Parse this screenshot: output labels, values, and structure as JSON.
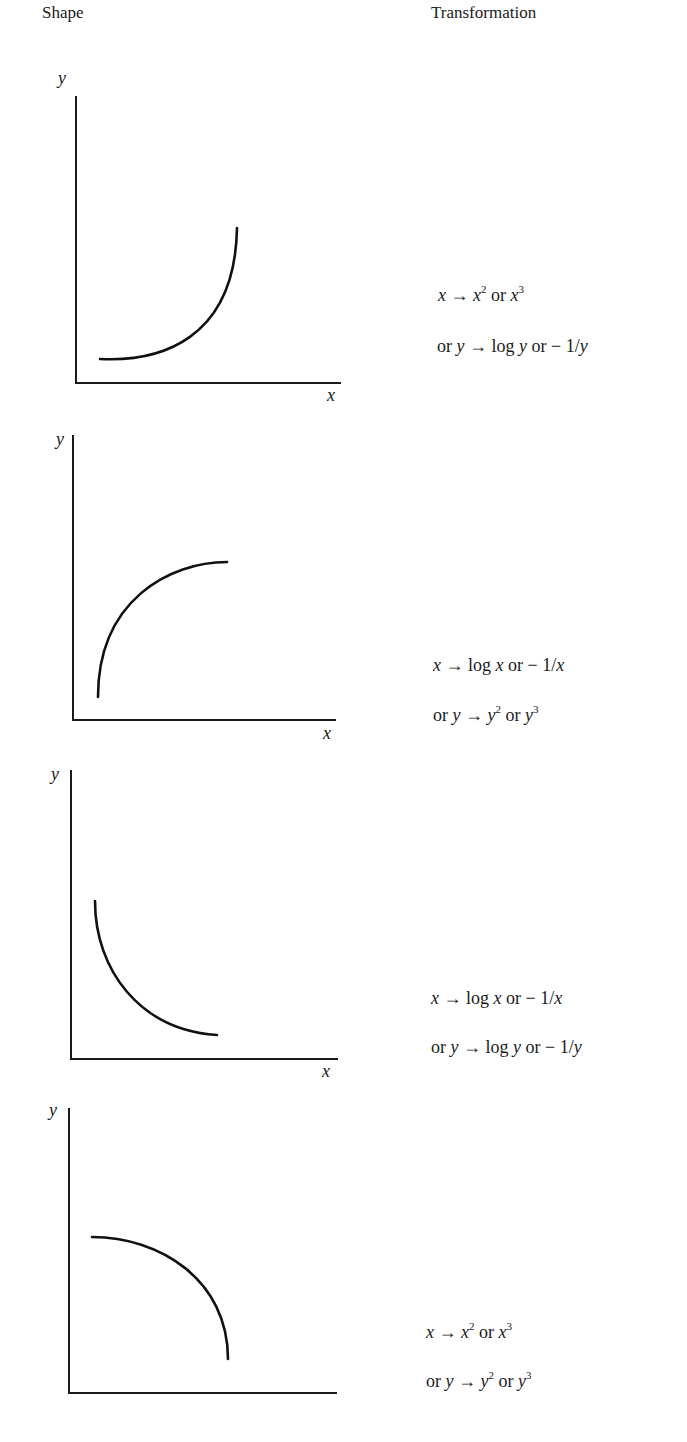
{
  "headers": {
    "shape": "Shape",
    "transformation": "Transformation"
  },
  "axis_labels": {
    "x": "x",
    "y": "y"
  },
  "panels": [
    {
      "shape": "convex increasing (curving upward)",
      "transformation": {
        "line1": {
          "var": "x",
          "arrow": "→",
          "a": "x",
          "a_exp": "2",
          "or": "or",
          "b": "x",
          "b_exp": "3"
        },
        "line2": {
          "prefix": "or",
          "var": "y",
          "arrow": "→",
          "text": "log",
          "a": "y",
          "or": "or",
          "neg": "− 1/",
          "b": "y"
        }
      },
      "text": [
        "x → x² or x³",
        "or y → log y or − 1/y"
      ]
    },
    {
      "shape": "concave increasing (levelling off)",
      "transformation": {
        "line1": {
          "var": "x",
          "arrow": "→",
          "text": "log",
          "a": "x",
          "or": "or",
          "neg": "− 1/",
          "b": "x"
        },
        "line2": {
          "prefix": "or",
          "var": "y",
          "arrow": "→",
          "a": "y",
          "a_exp": "2",
          "or": "or",
          "b": "y",
          "b_exp": "3"
        }
      },
      "text": [
        "x → log x or − 1/x",
        "or y → y² or y³"
      ]
    },
    {
      "shape": "convex decreasing",
      "transformation": {
        "line1": {
          "var": "x",
          "arrow": "→",
          "text": "log",
          "a": "x",
          "or": "or",
          "neg": "− 1/",
          "b": "x"
        },
        "line2": {
          "prefix": "or",
          "var": "y",
          "arrow": "→",
          "text": "log",
          "a": "y",
          "or": "or",
          "neg": "− 1/",
          "b": "y"
        }
      },
      "text": [
        "x → log x or − 1/x",
        "or y → log y or − 1/y"
      ]
    },
    {
      "shape": "concave decreasing",
      "transformation": {
        "line1": {
          "var": "x",
          "arrow": "→",
          "a": "x",
          "a_exp": "2",
          "or": "or",
          "b": "x",
          "b_exp": "3"
        },
        "line2": {
          "prefix": "or",
          "var": "y",
          "arrow": "→",
          "a": "y",
          "a_exp": "2",
          "or": "or",
          "b": "y",
          "b_exp": "3"
        }
      },
      "text": [
        "x → x² or x³",
        "or y → y² or y³"
      ]
    }
  ]
}
